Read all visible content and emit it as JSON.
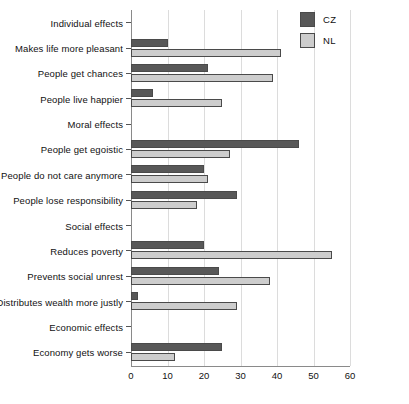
{
  "chart_data": {
    "type": "bar",
    "orientation": "horizontal",
    "title": "",
    "xlabel": "",
    "ylabel": "",
    "xlim": [
      0,
      60
    ],
    "xticks": [
      0,
      10,
      20,
      30,
      40,
      50,
      60
    ],
    "grid": true,
    "legend_position": "top-right",
    "categories": [
      "Individual effects",
      "Makes life more pleasant",
      "People get chances",
      "People live happier",
      "Moral effects",
      "People get egoistic",
      "People do not care anymore",
      "People lose responsibility",
      "Social effects",
      "Reduces poverty",
      "Prevents social unrest",
      "Distributes wealth more justly",
      "Economic effects",
      "Economy gets worse"
    ],
    "series": [
      {
        "name": "CZ",
        "color": "#585858",
        "values": [
          null,
          10,
          21,
          6,
          null,
          46,
          20,
          29,
          null,
          20,
          24,
          2,
          null,
          25
        ]
      },
      {
        "name": "NL",
        "color": "#cdcdcd",
        "values": [
          null,
          41,
          39,
          25,
          null,
          27,
          21,
          18,
          null,
          55,
          38,
          29,
          null,
          12
        ]
      }
    ]
  },
  "legend": {
    "items": [
      {
        "label": "CZ"
      },
      {
        "label": "NL"
      }
    ]
  },
  "axis": {
    "tick_labels": [
      "0",
      "10",
      "20",
      "30",
      "40",
      "50",
      "60"
    ]
  }
}
